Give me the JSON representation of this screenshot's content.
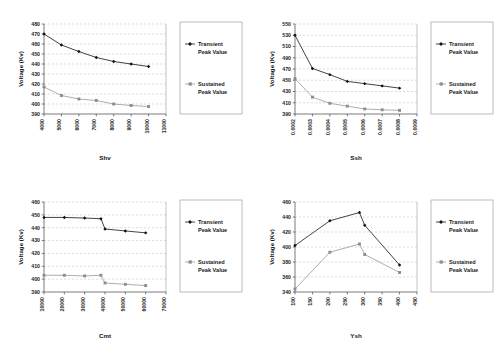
{
  "figure": {
    "background": "#ffffff",
    "panel_count": 4,
    "series_colors": {
      "transient": "#111111",
      "sustained": "#8c8c8c"
    },
    "gridline_color": "#b9b9b9",
    "axis_color": "#444444"
  },
  "legend": {
    "transient_label_line1": "Transient",
    "transient_label_line2": "Peak Value",
    "sustained_label_line1": "Sustained",
    "sustained_label_line2": "Peak Value",
    "position": "right-outside"
  },
  "chart_data": [
    {
      "id": "chart-shv",
      "type": "line",
      "title": "",
      "xlabel": "Shv",
      "ylabel": "Voltage (Kv)",
      "xlim": [
        4000,
        11000
      ],
      "ylim": [
        390,
        480
      ],
      "xticks": [
        4000,
        5000,
        6000,
        7000,
        8000,
        9000,
        10000,
        11000
      ],
      "xticklabels": [
        "4000",
        "5000",
        "6000",
        "7000",
        "8000",
        "9000",
        "10000",
        "11000"
      ],
      "yticks": [
        390,
        400,
        410,
        420,
        430,
        440,
        450,
        460,
        470,
        480
      ],
      "yticklabels": [
        "390",
        "400",
        "410",
        "420",
        "430",
        "440",
        "450",
        "460",
        "470",
        "480"
      ],
      "grid": true,
      "x": [
        4000,
        5000,
        6000,
        7000,
        8000,
        9000,
        10000
      ],
      "series": [
        {
          "name": "Transient Peak Value",
          "marker": "diamond",
          "color": "#111111",
          "values": [
            470.0,
            459.0,
            452.5,
            446.5,
            442.5,
            440.0,
            437.5
          ]
        },
        {
          "name": "Sustained Peak Value",
          "marker": "square",
          "color": "#8c8c8c",
          "values": [
            417.0,
            408.5,
            405.0,
            403.5,
            400.0,
            398.5,
            397.5
          ]
        }
      ]
    },
    {
      "id": "chart-ssh",
      "type": "line",
      "title": "",
      "xlabel": "Ssh",
      "ylabel": "Voltage (Kv)",
      "xlim": [
        0.0002,
        0.0009
      ],
      "ylim": [
        390,
        550
      ],
      "xticks": [
        0.0002,
        0.0003,
        0.0004,
        0.0005,
        0.0006,
        0.0007,
        0.0008,
        0.0009
      ],
      "xticklabels": [
        "0.0002",
        "0.0003",
        "0.0004",
        "0.0005",
        "0.0006",
        "0.0007",
        "0.0008",
        "0.0009"
      ],
      "yticks": [
        390,
        410,
        430,
        450,
        470,
        490,
        510,
        530,
        550
      ],
      "yticklabels": [
        "390",
        "410",
        "430",
        "450",
        "470",
        "490",
        "510",
        "530",
        "550"
      ],
      "grid": true,
      "x": [
        0.0002,
        0.0003,
        0.0004,
        0.0005,
        0.0006,
        0.0007,
        0.0008
      ],
      "series": [
        {
          "name": "Transient Peak Value",
          "marker": "diamond",
          "color": "#111111",
          "values": [
            530.0,
            471.0,
            460.0,
            448.0,
            444.0,
            440.0,
            436.0
          ]
        },
        {
          "name": "Sustained Peak Value",
          "marker": "square",
          "color": "#8c8c8c",
          "values": [
            453.0,
            420.0,
            409.0,
            404.0,
            399.0,
            397.5,
            396.5
          ]
        }
      ]
    },
    {
      "id": "chart-cmt",
      "type": "line",
      "title": "",
      "xlabel": "Cmt",
      "ylabel": "Voltage (Kv)",
      "xlim": [
        10000,
        70000
      ],
      "ylim": [
        390,
        460
      ],
      "xticks": [
        10000,
        20000,
        30000,
        40000,
        50000,
        60000,
        70000
      ],
      "xticklabels": [
        "10000",
        "20000",
        "30000",
        "40000",
        "50000",
        "60000",
        "70000"
      ],
      "yticks": [
        390,
        400,
        410,
        420,
        430,
        440,
        450,
        460
      ],
      "yticklabels": [
        "390",
        "400",
        "410",
        "420",
        "430",
        "440",
        "450",
        "460"
      ],
      "grid": true,
      "x": [
        10000,
        20000,
        30000,
        38000,
        40000,
        50000,
        60000
      ],
      "series": [
        {
          "name": "Transient Peak Value",
          "marker": "diamond",
          "color": "#111111",
          "values": [
            448.0,
            448.0,
            447.5,
            447.0,
            439.0,
            437.5,
            436.0
          ]
        },
        {
          "name": "Sustained Peak Value",
          "marker": "square",
          "color": "#8c8c8c",
          "values": [
            403.0,
            403.0,
            402.5,
            403.0,
            397.0,
            396.0,
            395.0
          ]
        }
      ]
    },
    {
      "id": "chart-ysh",
      "type": "line",
      "title": "",
      "xlabel": "Ysh",
      "ylabel": "Voltage (Kv)",
      "xlim": [
        100,
        450
      ],
      "ylim": [
        340,
        460
      ],
      "xticks": [
        100,
        150,
        200,
        250,
        300,
        350,
        400,
        450
      ],
      "xticklabels": [
        "100",
        "150",
        "200",
        "250",
        "300",
        "350",
        "400",
        "450"
      ],
      "yticks": [
        340,
        360,
        380,
        400,
        420,
        440,
        460
      ],
      "yticklabels": [
        "340",
        "360",
        "380",
        "400",
        "420",
        "440",
        "460"
      ],
      "grid": true,
      "x": [
        100,
        200,
        285,
        300,
        400
      ],
      "series": [
        {
          "name": "Transient Peak Value",
          "marker": "diamond",
          "color": "#111111",
          "values": [
            402.0,
            435.0,
            446.0,
            429.0,
            376.0
          ]
        },
        {
          "name": "Sustained Peak Value",
          "marker": "square",
          "color": "#8c8c8c",
          "values": [
            344.0,
            393.0,
            404.0,
            390.0,
            366.0
          ]
        }
      ]
    }
  ]
}
